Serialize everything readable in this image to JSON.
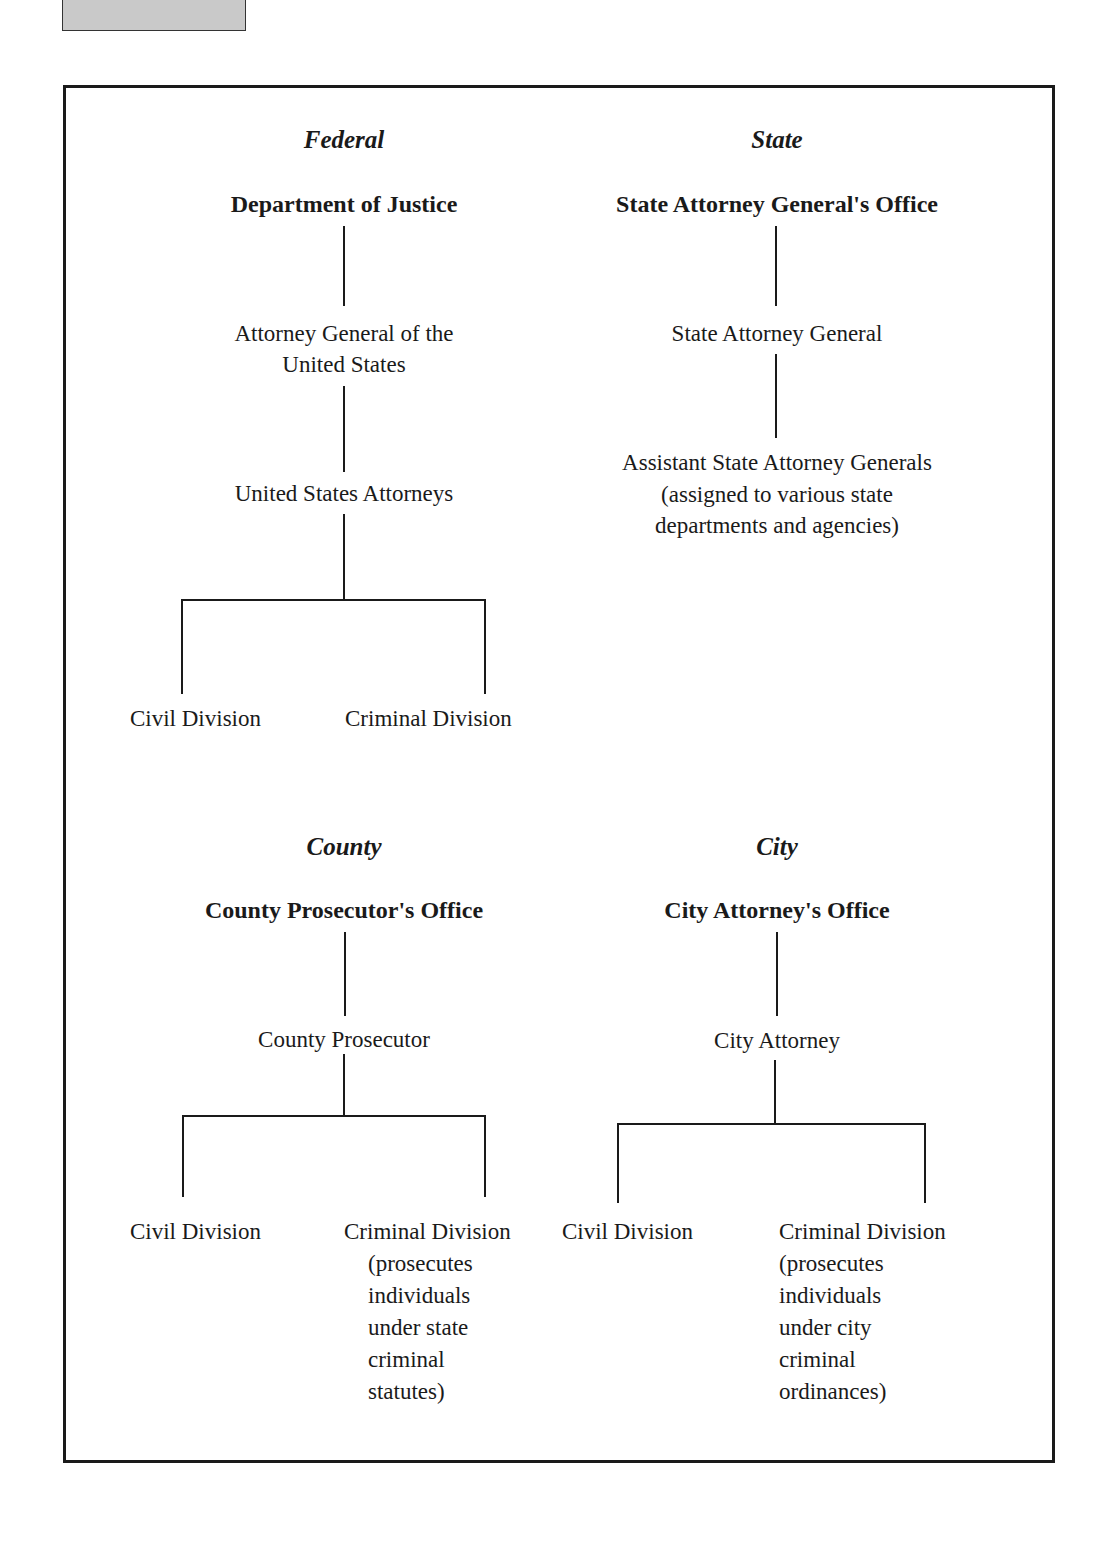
{
  "diagram": {
    "federal": {
      "section_title": "Federal",
      "office": "Department of Justice",
      "nodes": [
        "Attorney General of the",
        "United States",
        "United States Attorneys"
      ],
      "divisions": {
        "civil": "Civil Division",
        "criminal": "Criminal Division"
      }
    },
    "state": {
      "section_title": "State",
      "office": "State Attorney General's Office",
      "nodes": [
        "State Attorney General"
      ],
      "assistants": [
        "Assistant State Attorney Generals",
        "(assigned to various state",
        "departments and agencies)"
      ]
    },
    "county": {
      "section_title": "County",
      "office": "County Prosecutor's Office",
      "nodes": [
        "County Prosecutor"
      ],
      "divisions": {
        "civil": "Civil Division",
        "criminal": "Criminal Division",
        "criminal_note": [
          "(prosecutes",
          "individuals",
          "under state",
          "criminal",
          "statutes)"
        ]
      }
    },
    "city": {
      "section_title": "City",
      "office": "City Attorney's Office",
      "nodes": [
        "City Attorney"
      ],
      "divisions": {
        "civil": "Civil Division",
        "criminal": "Criminal Division",
        "criminal_note": [
          "(prosecutes",
          "individuals",
          "under city",
          "criminal",
          "ordinances)"
        ]
      }
    }
  }
}
